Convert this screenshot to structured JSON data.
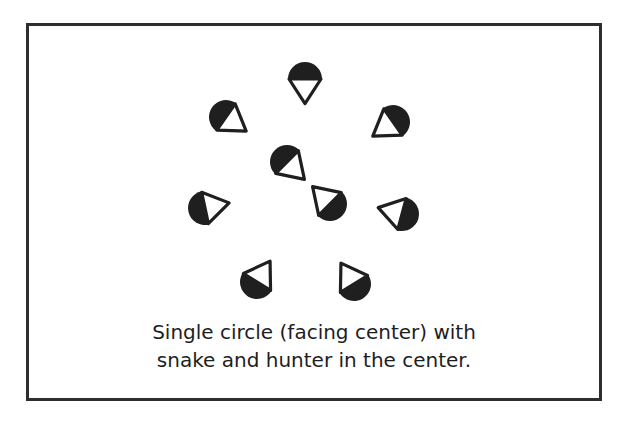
{
  "header": {
    "cutoff_text": ""
  },
  "diagram": {
    "colors": {
      "figure_fill": "#1f1f1f",
      "triangle_fill": "#ffffff",
      "triangle_stroke": "#1f1f1f",
      "frame_border": "#2e2e2e",
      "caption_text": "#1e1e1e"
    },
    "figure_radius": 17,
    "figures": [
      {
        "role": "circle-member",
        "position": "top",
        "cx": 305,
        "cy": 79,
        "facing_deg": 90
      },
      {
        "role": "circle-member",
        "position": "upper-left",
        "cx": 226,
        "cy": 117,
        "facing_deg": 35
      },
      {
        "role": "circle-member",
        "position": "upper-right",
        "cx": 393,
        "cy": 122,
        "facing_deg": 145
      },
      {
        "role": "circle-member",
        "position": "left",
        "cx": 205,
        "cy": 208,
        "facing_deg": -12
      },
      {
        "role": "circle-member",
        "position": "right",
        "cx": 402,
        "cy": 214,
        "facing_deg": 195
      },
      {
        "role": "circle-member",
        "position": "lower-left",
        "cx": 257,
        "cy": 282,
        "facing_deg": -58
      },
      {
        "role": "circle-member",
        "position": "lower-right",
        "cx": 354,
        "cy": 284,
        "facing_deg": -122
      },
      {
        "role": "snake-or-hunter",
        "position": "center-upper",
        "cx": 287,
        "cy": 162,
        "facing_deg": 45
      },
      {
        "role": "snake-or-hunter",
        "position": "center-lower",
        "cx": 330,
        "cy": 204,
        "facing_deg": -135
      }
    ]
  },
  "caption": {
    "line1": "Single circle (facing center) with",
    "line2": "snake and hunter in the center."
  }
}
